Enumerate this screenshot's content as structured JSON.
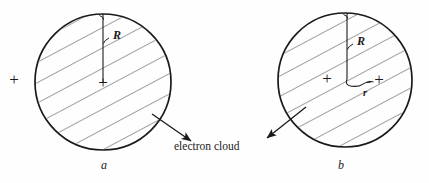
{
  "figure": {
    "background_color": "#fefefe",
    "stroke_color": "#1a1a1a",
    "panels": [
      {
        "id": "a",
        "letter": "a",
        "letter_x": 105,
        "letter_y": 166,
        "circle": {
          "cx": 103,
          "cy": 82,
          "r": 68
        },
        "radius_label": "R",
        "radius_label_x": 118,
        "radius_label_y": 36,
        "nucleus_plus": {
          "x": 103,
          "y": 82,
          "label": "+"
        },
        "external_plus": {
          "x": 14,
          "y": 79,
          "label": "+"
        },
        "displaced_plus": null,
        "offset_label": null
      },
      {
        "id": "b",
        "letter": "b",
        "letter_x": 341,
        "letter_y": 166,
        "circle": {
          "cx": 345,
          "cy": 80,
          "r": 67
        },
        "radius_label": "R",
        "radius_label_x": 362,
        "radius_label_y": 42,
        "nucleus_plus": {
          "x": 327,
          "y": 78,
          "label": "+"
        },
        "external_plus": null,
        "displaced_plus": {
          "x": 378,
          "y": 79,
          "label": "+"
        },
        "offset_label": "r",
        "offset_label_x": 366,
        "offset_label_y": 94
      }
    ],
    "annotation": {
      "text": "electron cloud",
      "x": 214,
      "y": 148,
      "arrows": [
        {
          "name": "arrow-from-panel-a",
          "x1": 152,
          "y1": 114,
          "x2": 193,
          "y2": 143
        },
        {
          "name": "arrow-from-panel-b",
          "x1": 306,
          "y1": 107,
          "x2": 265,
          "y2": 140
        }
      ]
    },
    "hatching": {
      "angle_degrees": -28,
      "spacing_px": 17.5,
      "stroke_width": 0.9
    }
  }
}
